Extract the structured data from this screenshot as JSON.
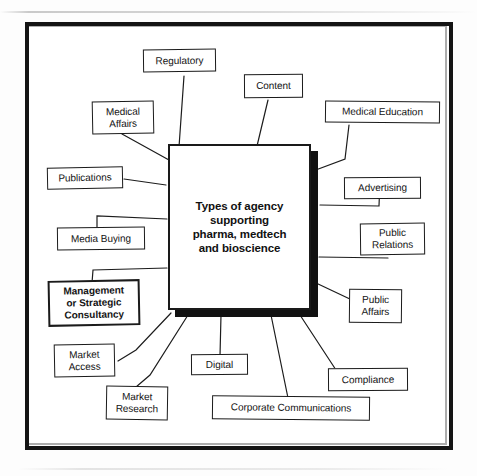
{
  "diagram": {
    "title_text": "Types of agency supporting pharma, medtech and bioscience",
    "hub": {
      "label": "Types of agency\nsupporting\npharma, medtech\nand bioscience"
    },
    "nodes": [
      {
        "id": "regulatory",
        "label": "Regulatory"
      },
      {
        "id": "content",
        "label": "Content"
      },
      {
        "id": "medical-education",
        "label": "Medical Education"
      },
      {
        "id": "advertising",
        "label": "Advertising"
      },
      {
        "id": "public-relations",
        "label": "Public\nRelations"
      },
      {
        "id": "public-affairs",
        "label": "Public\nAffairs"
      },
      {
        "id": "compliance",
        "label": "Compliance"
      },
      {
        "id": "corporate-communications",
        "label": "Corporate Communications"
      },
      {
        "id": "digital",
        "label": "Digital"
      },
      {
        "id": "market-research",
        "label": "Market\nResearch"
      },
      {
        "id": "market-access",
        "label": "Market\nAccess"
      },
      {
        "id": "management-consultancy",
        "label": "Management\nor Strategic\nConsultancy"
      },
      {
        "id": "media-buying",
        "label": "Media Buying"
      },
      {
        "id": "publications",
        "label": "Publications"
      },
      {
        "id": "medical-affairs",
        "label": "Medical\nAffairs"
      }
    ],
    "colors": {
      "ink": "#141414",
      "paper": "#ffffff",
      "shadow": "#111111"
    }
  }
}
